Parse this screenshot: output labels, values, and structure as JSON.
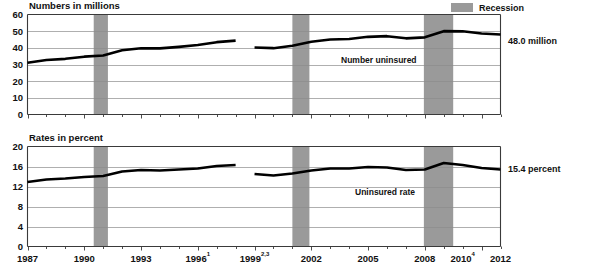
{
  "legend": {
    "recession_label": "Recession",
    "recession_color": "#9a9a9a"
  },
  "panels": {
    "top": {
      "axis_title": "Numbers in millions",
      "series_label": "Number uninsured",
      "end_label": "48.0 million",
      "y_ticks": [
        "60",
        "50",
        "40",
        "30",
        "20",
        "10",
        "0"
      ]
    },
    "bottom": {
      "axis_title": "Rates in percent",
      "series_label": "Uninsured rate",
      "end_label": "15.4 percent",
      "y_ticks": [
        "20",
        "16",
        "12",
        "8",
        "4",
        "0"
      ]
    }
  },
  "x_axis": {
    "tick_labels": [
      {
        "base": "1987",
        "sup": ""
      },
      {
        "base": "1990",
        "sup": ""
      },
      {
        "base": "1993",
        "sup": ""
      },
      {
        "base": "1996",
        "sup": "1"
      },
      {
        "base": "1999",
        "sup": "2,3"
      },
      {
        "base": "2002",
        "sup": ""
      },
      {
        "base": "2005",
        "sup": ""
      },
      {
        "base": "2008",
        "sup": ""
      },
      {
        "base": "2010",
        "sup": "4"
      },
      {
        "base": "2012",
        "sup": ""
      }
    ],
    "min": 1987,
    "max": 2012
  },
  "chart_data": {
    "type": "line",
    "xlabel": "",
    "ylabel": "",
    "grid": true,
    "legend_position": "top-right",
    "recessions": [
      {
        "start": 1990.5,
        "end": 1991.25
      },
      {
        "start": 2001.0,
        "end": 2001.9
      },
      {
        "start": 2007.95,
        "end": 2009.5
      }
    ],
    "panels": [
      {
        "name": "number-uninsured",
        "ylabel": "Numbers in millions",
        "ylim": [
          0,
          60
        ],
        "yticks": [
          0,
          10,
          20,
          30,
          40,
          50,
          60
        ],
        "units": "millions",
        "end_value": 48.0,
        "segments": [
          {
            "x": [
              1987,
              1988,
              1989,
              1990,
              1991,
              1992,
              1993,
              1994,
              1995,
              1996,
              1997,
              1998
            ],
            "y": [
              31.0,
              32.7,
              33.4,
              34.7,
              35.4,
              38.6,
              39.7,
              39.7,
              40.6,
              41.7,
              43.4,
              44.3
            ]
          },
          {
            "x": [
              1999,
              2000,
              2001,
              2002,
              2003,
              2004,
              2005,
              2006,
              2007,
              2008,
              2009,
              2010,
              2011,
              2012
            ],
            "y": [
              40.2,
              39.8,
              41.2,
              43.6,
              45.0,
              45.3,
              46.6,
              47.0,
              45.7,
              46.3,
              50.0,
              49.9,
              48.6,
              48.0
            ]
          }
        ]
      },
      {
        "name": "uninsured-rate",
        "ylabel": "Rates in percent",
        "ylim": [
          0,
          20
        ],
        "yticks": [
          0,
          4,
          8,
          12,
          16,
          20
        ],
        "units": "percent",
        "end_value": 15.4,
        "segments": [
          {
            "x": [
              1987,
              1988,
              1989,
              1990,
              1991,
              1992,
              1993,
              1994,
              1995,
              1996,
              1997,
              1998
            ],
            "y": [
              12.9,
              13.4,
              13.6,
              13.9,
              14.1,
              15.0,
              15.3,
              15.2,
              15.4,
              15.6,
              16.1,
              16.3
            ]
          },
          {
            "x": [
              1999,
              2000,
              2001,
              2002,
              2003,
              2004,
              2005,
              2006,
              2007,
              2008,
              2009,
              2010,
              2011,
              2012
            ],
            "y": [
              14.5,
              14.2,
              14.6,
              15.2,
              15.6,
              15.6,
              15.9,
              15.8,
              15.3,
              15.4,
              16.7,
              16.3,
              15.7,
              15.4
            ]
          }
        ]
      }
    ]
  }
}
